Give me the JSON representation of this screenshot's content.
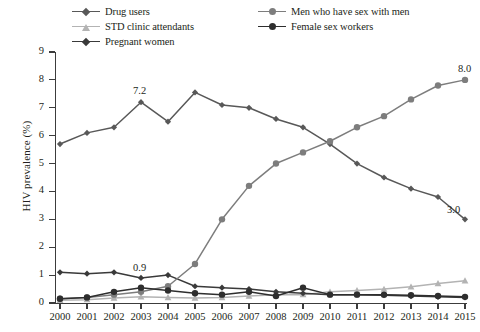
{
  "chart_data": {
    "type": "line",
    "title": "",
    "xlabel": "",
    "ylabel": "HIV prevalence (%)",
    "ylim": [
      0,
      9
    ],
    "yticks": [
      0,
      1,
      2,
      3,
      4,
      5,
      6,
      7,
      8,
      9
    ],
    "grid": false,
    "legend_position": "top",
    "categories": [
      "2000",
      "2001",
      "2002",
      "2003",
      "2004",
      "2005",
      "2006",
      "2007",
      "2008",
      "2009",
      "2010",
      "2011",
      "2012",
      "2013",
      "2014",
      "2015"
    ],
    "series": [
      {
        "name": "Drug users",
        "color": "#585858",
        "marker": "diamond",
        "values": [
          5.7,
          6.1,
          6.3,
          7.2,
          6.5,
          7.55,
          7.1,
          7.0,
          6.6,
          6.3,
          5.7,
          5.0,
          4.5,
          4.1,
          3.8,
          3.0
        ]
      },
      {
        "name": "STD clinic attendants",
        "color": "#b3b3b3",
        "marker": "triangle",
        "values": [
          0.1,
          0.12,
          0.18,
          0.22,
          0.2,
          0.18,
          0.2,
          0.25,
          0.3,
          0.3,
          0.4,
          0.45,
          0.5,
          0.58,
          0.7,
          0.8
        ]
      },
      {
        "name": "Pregnant women",
        "color": "#3a3a3a",
        "marker": "diamond",
        "values": [
          1.1,
          1.05,
          1.1,
          0.9,
          1.0,
          0.6,
          0.55,
          0.5,
          0.4,
          0.35,
          0.3,
          0.3,
          0.28,
          0.25,
          0.22,
          0.2
        ]
      },
      {
        "name": "Men who have sex with men",
        "color": "#7d7d7d",
        "marker": "circle",
        "values": [
          0.15,
          0.2,
          0.3,
          0.4,
          0.6,
          1.4,
          3.0,
          4.2,
          5.0,
          5.4,
          5.8,
          6.3,
          6.7,
          7.3,
          7.8,
          8.0
        ]
      },
      {
        "name": "Female sex workers",
        "color": "#2e2e2e",
        "marker": "circle",
        "values": [
          0.15,
          0.2,
          0.4,
          0.55,
          0.45,
          0.35,
          0.3,
          0.4,
          0.25,
          0.55,
          0.3,
          0.3,
          0.3,
          0.28,
          0.25,
          0.22
        ]
      }
    ],
    "annotations": [
      {
        "text": "7.2",
        "series": "Drug users",
        "category": "2003",
        "value": 7.2,
        "dx": -8,
        "dy": -17
      },
      {
        "text": "8.0",
        "series": "Men who have sex with men",
        "category": "2015",
        "value": 8.0,
        "dx": -7,
        "dy": -17
      },
      {
        "text": "0.9",
        "series": "Pregnant women",
        "category": "2003",
        "value": 0.9,
        "dx": -8,
        "dy": -16
      },
      {
        "text": "3.0",
        "series": "Drug users",
        "category": "2015",
        "value": 3.0,
        "dx": -18,
        "dy": -15
      }
    ]
  },
  "legend": {
    "items": [
      {
        "label": "Drug users",
        "color": "#585858",
        "marker": "diamond",
        "col": 1,
        "row": 0
      },
      {
        "label": "STD clinic attendants",
        "color": "#b3b3b3",
        "marker": "triangle",
        "col": 1,
        "row": 1
      },
      {
        "label": "Pregnant women",
        "color": "#3a3a3a",
        "marker": "diamond",
        "col": 1,
        "row": 2
      },
      {
        "label": "Men who have sex with men",
        "color": "#7d7d7d",
        "marker": "circle",
        "col": 2,
        "row": 0
      },
      {
        "label": "Female sex workers",
        "color": "#2e2e2e",
        "marker": "circle",
        "col": 2,
        "row": 1
      }
    ]
  },
  "axis": {
    "y_title": "HIV prevalence (%)"
  }
}
